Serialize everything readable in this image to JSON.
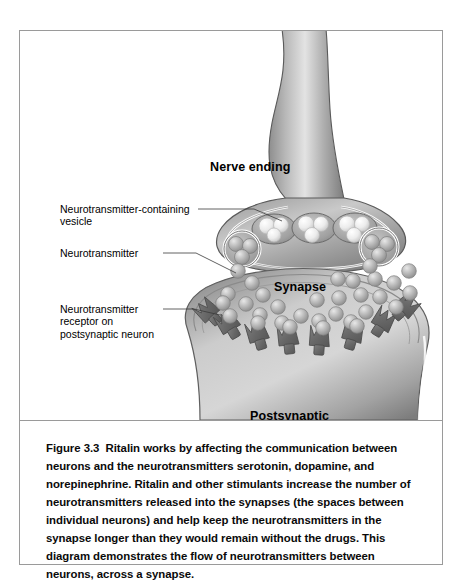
{
  "figure": {
    "caption_label": "Figure",
    "caption_number": "3.3",
    "caption_body": "Ritalin works by affecting the communication between neurons and the neurotransmitters serotonin, dopamine, and norepinephrine. Ritalin and other stimulants increase the number of neurotransmitters released into the synapses (the spaces between individual neurons) and help keep the neurotransmitters in the synapse longer than they would remain without the drugs. This diagram demonstrates the flow of neurotransmitters between neurons, across a synapse."
  },
  "diagram": {
    "title_labels": {
      "nerve_ending": "Nerve ending",
      "synapse": "Synapse",
      "postsynaptic_line1": "Postsynaptic",
      "postsynaptic_line2": "neuron"
    },
    "callouts": {
      "vesicle_line1": "Neurotransmitter-containing",
      "vesicle_line2": "vesicle",
      "neurotransmitter": "Neurotransmitter",
      "receptor_line1": "Neurotransmitter",
      "receptor_line2": "receptor on",
      "receptor_line3": "postsynaptic neuron"
    },
    "colors": {
      "frame_border": "#9a9a9a",
      "cell_light": "#d9d9d9",
      "cell_mid": "#a8a8a8",
      "cell_dark": "#6f6f6f",
      "receptor_fill": "#6b6b6b",
      "vesicle_sphere": "#f0f0f0",
      "neurotransmitter_sphere": "#b3b3b3",
      "outline": "#555555",
      "text": "#000000",
      "background": "#ffffff"
    }
  }
}
